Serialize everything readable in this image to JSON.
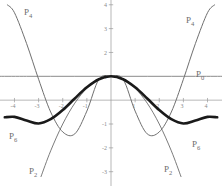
{
  "chart_data": {
    "type": "line",
    "title": "",
    "subtitle": "",
    "xlabel": "",
    "ylabel": "",
    "xlim": [
      -4.6,
      4.6
    ],
    "ylim": [
      -3.6,
      4.2
    ],
    "grid": false,
    "legend_position": "inline-curve-labels",
    "x_ticks": [
      -4,
      -3,
      -2,
      -1,
      1,
      2,
      3,
      4
    ],
    "x_tick_labels": [
      "-4",
      "-3",
      "-2",
      "-1",
      "1",
      "2",
      "3",
      "4"
    ],
    "y_ticks": [
      -3,
      -2,
      -1,
      1,
      2,
      3,
      4
    ],
    "y_tick_labels": [
      "-3",
      "-2",
      "-1",
      "1",
      "2",
      "3",
      "4"
    ],
    "series": [
      {
        "name": "P0",
        "label": "P",
        "subscript": "0",
        "color": "#8a8a8a",
        "width": 1.0,
        "description": "constant one",
        "x": [
          -4.6,
          -3.5,
          -2.5,
          -1.5,
          -0.5,
          0.5,
          1.5,
          2.5,
          3.5,
          4.6
        ],
        "values": [
          1,
          1,
          1,
          1,
          1,
          1,
          1,
          1,
          1,
          1
        ]
      },
      {
        "name": "P2",
        "label": "P",
        "subscript": "2",
        "color": "#7c7c7c",
        "width": 1.0,
        "description": "downward parabola",
        "x": [
          -2.9,
          -2.5,
          -2.0,
          -1.5,
          -1.0,
          -0.5,
          0,
          0.5,
          1.0,
          1.5,
          2.0,
          2.5,
          2.9
        ],
        "values": [
          -3.205,
          -2.125,
          -1.0,
          -0.125,
          0.5,
          0.875,
          1.0,
          0.875,
          0.5,
          -0.125,
          -1.0,
          -2.125,
          -3.205
        ]
      },
      {
        "name": "P4",
        "label": "P",
        "subscript": "4",
        "color": "#6f6f6f",
        "width": 1.0,
        "description": "quartic rising at edges",
        "x": [
          -4.3,
          -4.0,
          -3.5,
          -3.0,
          -2.5,
          -2.0,
          -1.5,
          -1.0,
          -0.5,
          0,
          0.5,
          1.0,
          1.5,
          2.0,
          2.5,
          3.0,
          3.5,
          4.0,
          4.3
        ],
        "values": [
          4.0,
          3.667,
          2.38,
          0.875,
          -0.497,
          -1.333,
          -1.414,
          -0.458,
          0.878,
          1.0,
          0.878,
          -0.458,
          -1.414,
          -1.333,
          -0.497,
          0.875,
          2.38,
          3.667,
          4.0
        ]
      },
      {
        "name": "P6",
        "label": "P",
        "subscript": "6",
        "color": "#1a1a1a",
        "width": 2.6,
        "description": "sextic approximation of cosine",
        "x": [
          -4.4,
          -4.0,
          -3.5,
          -3.0,
          -2.5,
          -2.0,
          -1.5,
          -1.0,
          -0.5,
          0,
          0.5,
          1.0,
          1.5,
          2.0,
          2.5,
          3.0,
          3.5,
          4.0,
          4.4
        ],
        "values": [
          -0.72,
          -0.7,
          -0.85,
          -0.98,
          -0.8,
          -0.416,
          0.071,
          0.54,
          0.878,
          1.0,
          0.878,
          0.54,
          0.071,
          -0.416,
          -0.8,
          -0.98,
          -0.85,
          -0.7,
          -0.72
        ]
      }
    ],
    "labels": [
      {
        "name": "p4-left",
        "text": "P",
        "subscript": "4",
        "x_px": 24,
        "y_px": 8
      },
      {
        "name": "p4-right",
        "text": "P",
        "subscript": "4",
        "x_px": 186,
        "y_px": 16
      },
      {
        "name": "p0-right",
        "text": "P",
        "subscript": "0",
        "x_px": 196,
        "y_px": 70
      },
      {
        "name": "p6-left",
        "text": "P",
        "subscript": "6",
        "x_px": 9,
        "y_px": 132
      },
      {
        "name": "p6-right",
        "text": "P",
        "subscript": "6",
        "x_px": 192,
        "y_px": 140
      },
      {
        "name": "p2-left",
        "text": "P",
        "subscript": "2",
        "x_px": 29,
        "y_px": 167
      },
      {
        "name": "p2-right",
        "text": "P",
        "subscript": "2",
        "x_px": 164,
        "y_px": 165
      }
    ],
    "axis_color": "#9a9a9a",
    "tick_label_color": "#8a8a8a",
    "background": "#ffffff"
  }
}
